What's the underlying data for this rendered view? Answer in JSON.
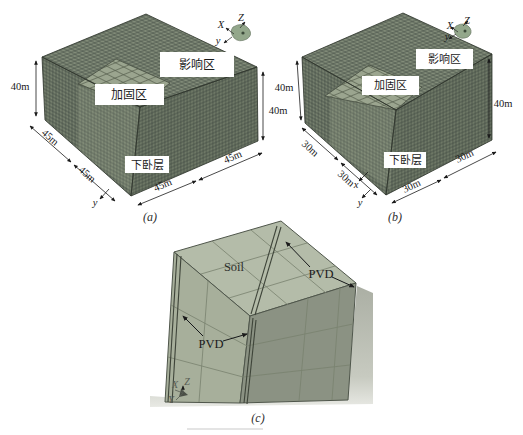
{
  "figure": {
    "panel_a": {
      "caption": "(a)",
      "zone_influence": "影响区",
      "zone_reinforced": "加固区",
      "zone_underlying": "下卧层",
      "height_left": "40m",
      "height_right": "40m",
      "edge_dims": [
        "45m",
        "45m",
        "45m",
        "45m"
      ],
      "axis_x": "X",
      "axis_z": "Z",
      "axis_y": "y",
      "origin_y": "y"
    },
    "panel_b": {
      "caption": "(b)",
      "zone_influence": "影响区",
      "zone_reinforced": "加固区",
      "zone_underlying": "下卧层",
      "height_left": "40m",
      "height_right": "40m",
      "edge_dims": [
        "30m",
        "30m",
        "30m",
        "30m"
      ],
      "axis_x": "X",
      "axis_z": "Z",
      "axis_y": "y",
      "origin_x": "x",
      "origin_y": "y"
    },
    "panel_c": {
      "caption": "(c)",
      "soil_label": "Soil",
      "pvd_left": "PVD",
      "pvd_right": "PVD",
      "axis_x": "X",
      "axis_z": "Z",
      "axis_y": "Y"
    },
    "colors": {
      "mesh_top": "#828c79",
      "mesh_left": "#757f6d",
      "mesh_right": "#6e7866",
      "mesh_line": "#3a423b",
      "reinforced_top": "#9ba58f",
      "column_top": "#b4bca9",
      "column_left": "#a7af9b",
      "column_right": "#8b9283",
      "ground": "#b3b7ac",
      "axis_icon": "#93a78b",
      "pvd_line": "#3e4439"
    }
  }
}
